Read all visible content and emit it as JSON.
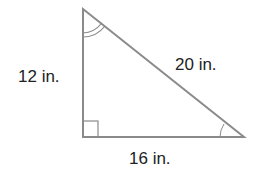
{
  "diagram": {
    "type": "right-triangle",
    "labels": {
      "left_side": "12 in.",
      "hypotenuse": "20 in.",
      "bottom_side": "16 in."
    },
    "markings": {
      "right_angle": "bottom-left",
      "double_arc_angle": "top",
      "single_arc_angle": "bottom-right"
    },
    "colors": {
      "stroke": "#8a8a8a",
      "text": "#222222"
    }
  }
}
